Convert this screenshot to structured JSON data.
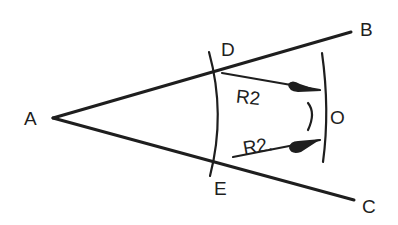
{
  "diagram": {
    "type": "angle-bisection-construction",
    "points": {
      "A": {
        "label": "A",
        "x": 53,
        "y": 118
      },
      "B": {
        "label": "B",
        "x": 351,
        "y": 32
      },
      "C": {
        "label": "C",
        "x": 354,
        "y": 200
      },
      "D": {
        "label": "D",
        "x": 216,
        "y": 71
      },
      "E": {
        "label": "E",
        "x": 214,
        "y": 158
      },
      "O": {
        "label": "O",
        "x": 315,
        "y": 113
      }
    },
    "labels": {
      "A": "A",
      "B": "B",
      "C": "C",
      "D": "D",
      "E": "E",
      "O": "O",
      "radius_upper": "R2",
      "radius_lower": "R2."
    },
    "stroke_color": "#1e1e1e",
    "background": "#ffffff"
  }
}
